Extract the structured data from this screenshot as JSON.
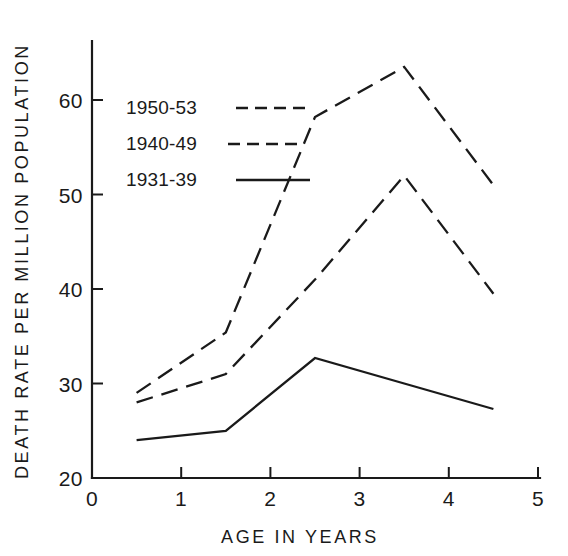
{
  "chart_data": {
    "type": "line",
    "title": "",
    "xlabel": "AGE IN YEARS",
    "ylabel": "DEATH RATE PER MILLION POPULATION",
    "xlim": [
      0,
      5
    ],
    "ylim": [
      20,
      65
    ],
    "grid": false,
    "legend_position": "upper-left-inside",
    "x": [
      0.5,
      1.5,
      2.5,
      3.5,
      4.5
    ],
    "xticks": [
      "0",
      "1",
      "2",
      "3",
      "4",
      "5"
    ],
    "xtick_values": [
      0,
      1,
      2,
      3,
      4,
      5
    ],
    "yticks": [
      "20",
      "30",
      "40",
      "50",
      "60"
    ],
    "ytick_values": [
      20,
      30,
      40,
      50,
      60
    ],
    "series": [
      {
        "name": "1950-53",
        "style": "dashed",
        "color": "#1a1a1a",
        "values": [
          29.0,
          35.4,
          58.2,
          63.5,
          51.0
        ]
      },
      {
        "name": "1940-49",
        "style": "dashed",
        "color": "#1a1a1a",
        "values": [
          28.0,
          31.0,
          41.0,
          52.0,
          39.5
        ]
      },
      {
        "name": "1931-39",
        "style": "solid",
        "color": "#1a1a1a",
        "values": [
          24.0,
          25.0,
          32.7,
          30.0,
          27.3
        ]
      }
    ]
  },
  "legend": {
    "entries": [
      {
        "label": "1950-53",
        "style": "dashed"
      },
      {
        "label": "1940-49",
        "style": "dashed"
      },
      {
        "label": "1931-39",
        "style": "solid"
      }
    ]
  }
}
